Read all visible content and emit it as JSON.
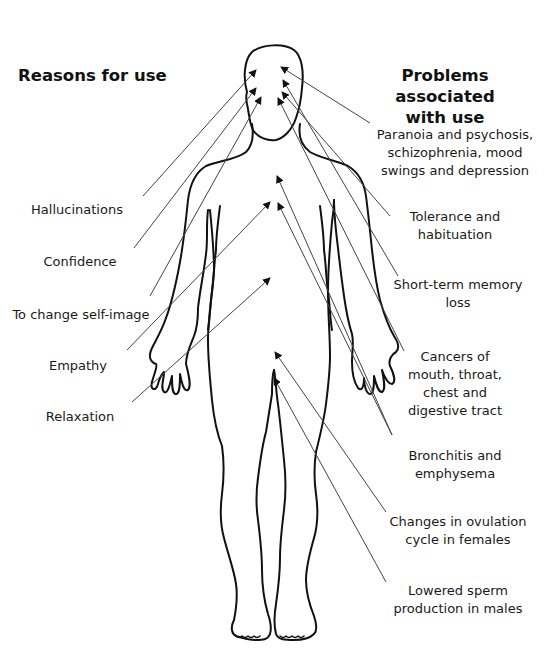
{
  "headings": {
    "left": "Reasons for use",
    "right_line1": "Problems associated",
    "right_line2": "with use"
  },
  "reasons": [
    {
      "label": "Hallucinations"
    },
    {
      "label": "Confidence"
    },
    {
      "label": "To change self-image"
    },
    {
      "label": "Empathy"
    },
    {
      "label": "Relaxation"
    }
  ],
  "problems": [
    {
      "lines": [
        "Paranoia and psychosis,",
        "schizophrenia, mood",
        "swings and depression"
      ]
    },
    {
      "lines": [
        "Tolerance and",
        "habituation"
      ]
    },
    {
      "lines": [
        "Short-term memory",
        "loss"
      ]
    },
    {
      "lines": [
        "Cancers of",
        "mouth, throat,",
        "chest and",
        "digestive tract"
      ]
    },
    {
      "lines": [
        "Bronchitis and",
        "emphysema"
      ]
    },
    {
      "lines": [
        "Changes in ovulation",
        "cycle in females"
      ]
    },
    {
      "lines": [
        "Lowered sperm",
        "production in males"
      ]
    }
  ],
  "figure": {
    "icon": "human-body-outline-icon",
    "line_color": "#111111",
    "pointer_color": "#333333"
  }
}
